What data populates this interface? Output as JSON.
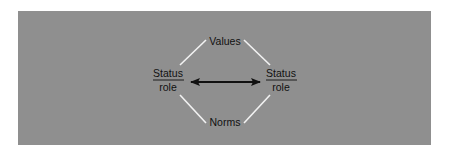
{
  "diagram": {
    "title": "",
    "colors": {
      "background": "#ffffff",
      "panel": "#8f8f8f",
      "connector_lines": "#f2f2f2",
      "arrow": "#111111",
      "text": "#111111"
    },
    "nodes": {
      "top": {
        "label": "Values"
      },
      "bottom": {
        "label": "Norms"
      },
      "left": {
        "numerator": "Status",
        "denominator": "role"
      },
      "right": {
        "numerator": "Status",
        "denominator": "role"
      }
    },
    "edges": [
      {
        "from": "left",
        "to": "top",
        "style": "plain-line"
      },
      {
        "from": "top",
        "to": "right",
        "style": "plain-line"
      },
      {
        "from": "left",
        "to": "bottom",
        "style": "plain-line"
      },
      {
        "from": "bottom",
        "to": "right",
        "style": "plain-line"
      },
      {
        "from": "left",
        "to": "right",
        "style": "double-headed-arrow"
      }
    ]
  }
}
